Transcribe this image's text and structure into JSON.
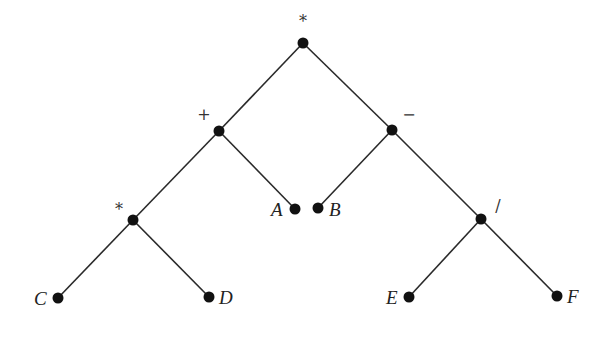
{
  "diagram": {
    "type": "expression-tree",
    "nodes": [
      {
        "id": "root",
        "label": "*",
        "kind": "operator",
        "x": 303,
        "y": 43,
        "label_x": 303,
        "label_y": 27
      },
      {
        "id": "plus",
        "label": "+",
        "kind": "operator",
        "x": 219,
        "y": 131,
        "label_x": 204,
        "label_y": 120
      },
      {
        "id": "minus",
        "label": "−",
        "kind": "operator",
        "x": 392,
        "y": 130,
        "label_x": 409,
        "label_y": 120
      },
      {
        "id": "times2",
        "label": "*",
        "kind": "operator",
        "x": 133,
        "y": 220,
        "label_x": 119,
        "label_y": 215
      },
      {
        "id": "A",
        "label": "A",
        "kind": "leaf",
        "x": 295,
        "y": 209,
        "label_x": 271,
        "label_y": 216
      },
      {
        "id": "B",
        "label": "B",
        "kind": "leaf",
        "x": 318,
        "y": 208,
        "label_x": 329,
        "label_y": 216
      },
      {
        "id": "div",
        "label": "/",
        "kind": "operator",
        "x": 481,
        "y": 219,
        "label_x": 498,
        "label_y": 211
      },
      {
        "id": "C",
        "label": "C",
        "kind": "leaf",
        "x": 58,
        "y": 298,
        "label_x": 34,
        "label_y": 305
      },
      {
        "id": "D",
        "label": "D",
        "kind": "leaf",
        "x": 209,
        "y": 297,
        "label_x": 219,
        "label_y": 304
      },
      {
        "id": "E",
        "label": "E",
        "kind": "leaf",
        "x": 409,
        "y": 297,
        "label_x": 386,
        "label_y": 304
      },
      {
        "id": "F",
        "label": "F",
        "kind": "leaf",
        "x": 557,
        "y": 296,
        "label_x": 567,
        "label_y": 303
      }
    ],
    "edges": [
      {
        "from": "root",
        "to": "plus"
      },
      {
        "from": "root",
        "to": "minus"
      },
      {
        "from": "plus",
        "to": "times2"
      },
      {
        "from": "plus",
        "to": "A"
      },
      {
        "from": "minus",
        "to": "B"
      },
      {
        "from": "minus",
        "to": "div"
      },
      {
        "from": "times2",
        "to": "C"
      },
      {
        "from": "times2",
        "to": "D"
      },
      {
        "from": "div",
        "to": "E"
      },
      {
        "from": "div",
        "to": "F"
      }
    ],
    "expression": "((C * D) + A) * (B − (E / F))",
    "colors": {
      "node": "#111111",
      "edge": "#2a2a2a",
      "text": "#222222",
      "background": "#ffffff"
    }
  }
}
